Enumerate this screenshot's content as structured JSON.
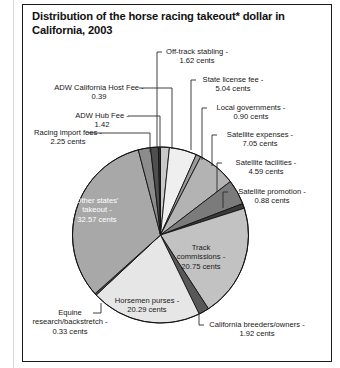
{
  "figure": {
    "title": "Distribution of the horse racing takeout* dollar in California, 2003",
    "frame_color": "#1b1b1b",
    "background": "#ffffff"
  },
  "chart_data": {
    "type": "pie",
    "title": "Distribution of the horse racing takeout* dollar in California, 2003",
    "unit": "cents",
    "total": 100.0,
    "start_angle_deg": -90,
    "direction": "clockwise",
    "legend": "none",
    "grid": false,
    "labels_inside": [
      "Other states' takeout",
      "Track commissions",
      "Horsemen purses"
    ],
    "categories": [
      "Off-track stabling",
      "State license fee",
      "Local governments",
      "Satellite expenses",
      "Satellite facilities",
      "Satellite promotion",
      "Track commissions",
      "California breeders/owners",
      "Horsemen purses",
      "Equine research/backstretch",
      "Other states' takeout",
      "Racing import fees",
      "ADW Hub Fee",
      "ADW California Host Fee"
    ],
    "values": [
      1.62,
      5.04,
      0.9,
      7.05,
      4.59,
      0.88,
      20.75,
      1.92,
      20.29,
      0.33,
      32.57,
      2.25,
      1.42,
      0.39
    ],
    "colors": [
      "#c9c9c9",
      "#efefef",
      "#9a9a9a",
      "#b3b3b3",
      "#7b7b7b",
      "#3a3a3a",
      "#c2c2c2",
      "#585858",
      "#e6e6e6",
      "#4a4a4a",
      "#a8a8a8",
      "#8c8c8c",
      "#4f4f4f",
      "#2e2e2e"
    ],
    "slices": [
      {
        "name": "Off-track stabling",
        "value": 1.62,
        "label": "Off-track stabling -",
        "value_label": "1.62 cents",
        "color": "#c9c9c9"
      },
      {
        "name": "State license fee",
        "value": 5.04,
        "label": "State license fee -",
        "value_label": "5.04 cents",
        "color": "#efefef"
      },
      {
        "name": "Local governments",
        "value": 0.9,
        "label": "Local governments -",
        "value_label": "0.90 cents",
        "color": "#9a9a9a"
      },
      {
        "name": "Satellite expenses",
        "value": 7.05,
        "label": "Satellite expenses -",
        "value_label": "7.05 cents",
        "color": "#b3b3b3"
      },
      {
        "name": "Satellite facilities",
        "value": 4.59,
        "label": "Satellite facilities -",
        "value_label": "4.59 cents",
        "color": "#7b7b7b"
      },
      {
        "name": "Satellite promotion",
        "value": 0.88,
        "label": "Satellite promotion -",
        "value_label": "0.88 cents",
        "color": "#3a3a3a"
      },
      {
        "name": "Track commissions",
        "value": 20.75,
        "label": "Track",
        "value_label": "20.75 cents",
        "color": "#c2c2c2",
        "label_line2": "commissions -"
      },
      {
        "name": "California breeders/owners",
        "value": 1.92,
        "label": "California breeders/owners -",
        "value_label": "1.92 cents",
        "color": "#585858"
      },
      {
        "name": "Horsemen purses",
        "value": 20.29,
        "label": "Horsemen purses -",
        "value_label": "20.29 cents",
        "color": "#e6e6e6"
      },
      {
        "name": "Equine research/backstretch",
        "value": 0.33,
        "label": "research/backstretch -",
        "value_label": "0.33 cents",
        "color": "#4a4a4a",
        "label_line1": "Equine"
      },
      {
        "name": "Other states' takeout",
        "value": 32.57,
        "label": "Other states'",
        "value_label": "32.57 cents",
        "color": "#a8a8a8",
        "label_line2": "takeout -"
      },
      {
        "name": "Racing import fees",
        "value": 2.25,
        "label": "Racing import fees -",
        "value_label": "2.25 cents",
        "color": "#8c8c8c"
      },
      {
        "name": "ADW Hub Fee",
        "value": 1.42,
        "label": "ADW Hub Fee -",
        "value_label": "1.42",
        "color": "#4f4f4f"
      },
      {
        "name": "ADW California Host Fee",
        "value": 0.39,
        "label": "ADW California Host Fee -",
        "value_label": "0.39",
        "color": "#2e2e2e"
      }
    ]
  },
  "callouts": {
    "off_track_stabling_1": "Off-track stabling -",
    "off_track_stabling_2": "1.62 cents",
    "state_license_1": "State license fee -",
    "state_license_2": "5.04 cents",
    "local_gov_1": "Local governments -",
    "local_gov_2": "0.90 cents",
    "sat_exp_1": "Satellite expenses -",
    "sat_exp_2": "7.05 cents",
    "sat_fac_1": "Satellite facilities -",
    "sat_fac_2": "4.59 cents",
    "sat_prom_1": "Satellite promotion -",
    "sat_prom_2": "0.88 cents",
    "ca_breeders_1": "California breeders/owners -",
    "ca_breeders_2": "1.92 cents",
    "equine_1": "Equine",
    "equine_2": "research/backstretch -",
    "equine_3": "0.33 cents",
    "racing_import_1": "Racing import fees -",
    "racing_import_2": "2.25 cents",
    "adw_hub_1": "ADW Hub Fee -",
    "adw_hub_2": "1.42",
    "adw_host_1": "ADW California Host Fee -",
    "adw_host_2": "0.39",
    "track_comm_1": "Track",
    "track_comm_2": "commissions -",
    "track_comm_3": "20.75 cents",
    "horsemen_1": "Horsemen purses -",
    "horsemen_2": "20.29 cents",
    "other_states_1": "Other states'",
    "other_states_2": "takeout -",
    "other_states_3": "32.57 cents"
  }
}
